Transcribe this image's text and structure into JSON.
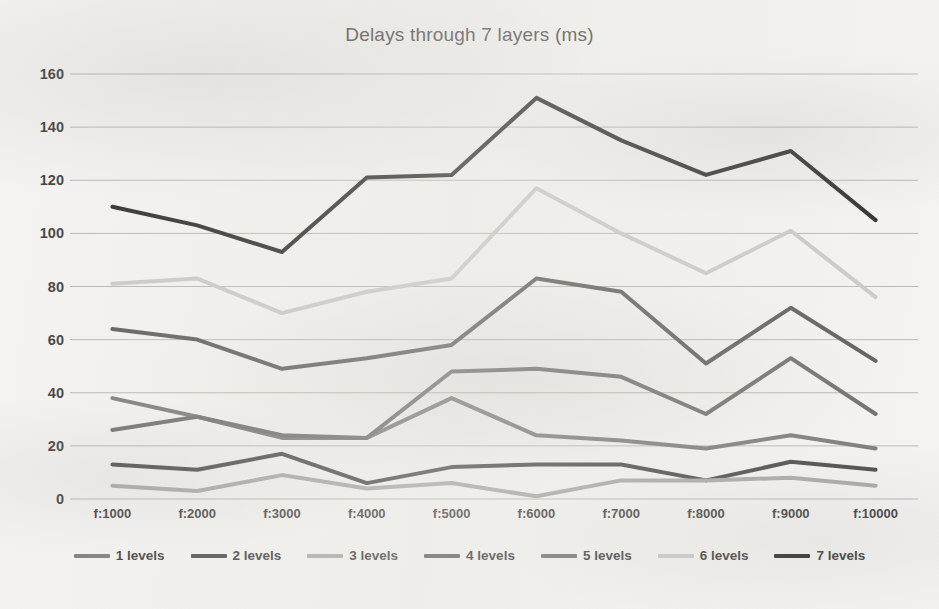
{
  "chart_data": {
    "type": "line",
    "title": "Delays through 7 layers (ms)",
    "xlabel": "",
    "ylabel": "",
    "ylim": [
      0,
      160
    ],
    "ytick_step": 20,
    "yticks": [
      "160",
      "140",
      "120",
      "100",
      "80",
      "60",
      "40",
      "20",
      "0"
    ],
    "grid": true,
    "legend_position": "bottom",
    "categories": [
      "f:1000",
      "f:2000",
      "f:3000",
      "f:4000",
      "f:5000",
      "f:6000",
      "f:7000",
      "f:8000",
      "f:9000",
      "f:10000"
    ],
    "series": [
      {
        "name": "1 levels",
        "color": "#7b7b7b",
        "values": [
          38,
          31,
          23,
          23,
          38,
          24,
          22,
          19,
          24,
          19
        ]
      },
      {
        "name": "2 levels",
        "color": "#4a4a4a",
        "values": [
          13,
          11,
          17,
          6,
          12,
          13,
          13,
          7,
          14,
          11
        ]
      },
      {
        "name": "3 levels",
        "color": "#a8a8a8",
        "values": [
          5,
          3,
          9,
          4,
          6,
          1,
          7,
          7,
          8,
          5
        ]
      },
      {
        "name": "4 levels",
        "color": "#5c5c5c",
        "values": [
          64,
          60,
          49,
          53,
          58,
          83,
          78,
          51,
          72,
          52
        ]
      },
      {
        "name": "5 levels",
        "color": "#6e6e6e",
        "values": [
          26,
          31,
          24,
          23,
          48,
          49,
          46,
          32,
          53,
          32
        ]
      },
      {
        "name": "6 levels",
        "color": "#c9c9c9",
        "values": [
          81,
          83,
          70,
          78,
          83,
          117,
          100,
          85,
          101,
          76
        ]
      },
      {
        "name": "7 levels",
        "color": "#2b2b2b",
        "values": [
          110,
          103,
          93,
          121,
          122,
          151,
          135,
          122,
          131,
          105
        ]
      }
    ],
    "legend": [
      "1 levels",
      "2 levels",
      "3 levels",
      "4 levels",
      "5 levels",
      "6 levels",
      "7 levels"
    ]
  },
  "plot_geometry": {
    "left": 70,
    "right": 918,
    "top": 74,
    "bottom": 499
  }
}
